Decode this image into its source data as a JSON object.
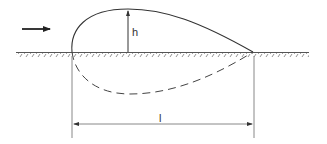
{
  "diagram": {
    "type": "bubble-on-wall profile",
    "labels": {
      "height": "h",
      "length": "l"
    },
    "elements": [
      "flow-direction-arrow",
      "wall-surface-hatched",
      "upper-profile-solid",
      "lower-mirror-profile-dashed",
      "height-dimension-arrow",
      "length-dimension-arrow"
    ],
    "colors": {
      "stroke": "#333333",
      "light_stroke": "#888888",
      "background": "#ffffff"
    }
  }
}
